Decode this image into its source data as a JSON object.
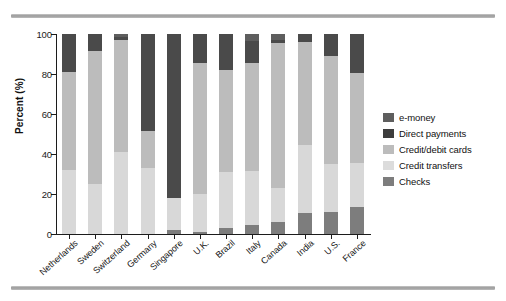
{
  "chart_data": {
    "type": "bar",
    "subtype": "stacked-bar-100-percent",
    "title": "",
    "xlabel": "",
    "ylabel": "Percent (%)",
    "ylim": [
      0,
      100
    ],
    "yticks": [
      0,
      20,
      40,
      60,
      80,
      100
    ],
    "grid": false,
    "legend_position": "right",
    "categories": [
      "Netherlands",
      "Sweden",
      "Switzerland",
      "Germany",
      "Singapore",
      "U.K.",
      "Brazil",
      "Italy",
      "Canada",
      "India",
      "U.S.",
      "France"
    ],
    "series": [
      {
        "name": "Checks",
        "color": "#7d7d7d",
        "values": [
          0,
          0,
          0,
          0,
          2.0,
          1.0,
          3.0,
          4.5,
          6.0,
          10.5,
          11.0,
          13.5
        ]
      },
      {
        "name": "Credit transfers",
        "color": "#d8d8d8",
        "values": [
          32.0,
          25.0,
          41.0,
          33.0,
          16.0,
          19.0,
          28.0,
          27.0,
          17.0,
          34.0,
          24.0,
          22.0
        ]
      },
      {
        "name": "Credit/debit cards",
        "color": "#bcbcbc",
        "values": [
          49.0,
          66.5,
          56.0,
          18.5,
          0.0,
          65.5,
          51.0,
          54.0,
          72.5,
          51.5,
          54.0,
          45.0
        ]
      },
      {
        "name": "Direct payments",
        "color": "#4a4a4a",
        "values": [
          19.0,
          8.5,
          1.5,
          48.5,
          82.0,
          14.5,
          18.0,
          11.0,
          1.5,
          4.0,
          11.0,
          19.5
        ]
      },
      {
        "name": "e-money",
        "color": "#5e5e5e",
        "values": [
          0,
          0,
          1.5,
          0,
          0,
          0,
          0,
          3.5,
          3.0,
          0,
          0,
          0
        ]
      }
    ],
    "legend_entries": [
      {
        "label": "e-money",
        "color": "#5e5e5e"
      },
      {
        "label": "Direct payments",
        "color": "#3d3d3d"
      },
      {
        "label": "Credit/debit cards",
        "color": "#bcbcbc"
      },
      {
        "label": "Credit transfers",
        "color": "#dcdcdc"
      },
      {
        "label": "Checks",
        "color": "#7d7d7d"
      }
    ]
  },
  "figure": {
    "axis_color": "#1c1c1c",
    "background": "#ffffff",
    "rule_color": "#9a9a9a"
  }
}
